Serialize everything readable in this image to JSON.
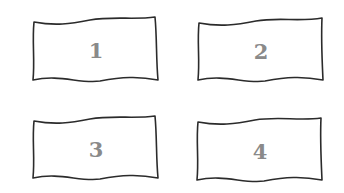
{
  "diagram": {
    "type": "grid-of-wavy-boxes",
    "layout": {
      "rows": 2,
      "columns": 2
    },
    "colors": {
      "outline": "#2b2b2b",
      "label": "#8a8a8a",
      "background": "#ffffff"
    },
    "boxes": [
      {
        "id": "1",
        "label": "1",
        "x": 33,
        "y": 21,
        "w": 124,
        "h": 59
      },
      {
        "id": "2",
        "label": "2",
        "x": 199,
        "y": 22,
        "w": 123,
        "h": 58
      },
      {
        "id": "3",
        "label": "3",
        "x": 33,
        "y": 120,
        "w": 124,
        "h": 58
      },
      {
        "id": "4",
        "label": "4",
        "x": 197,
        "y": 121,
        "w": 125,
        "h": 59
      }
    ]
  }
}
